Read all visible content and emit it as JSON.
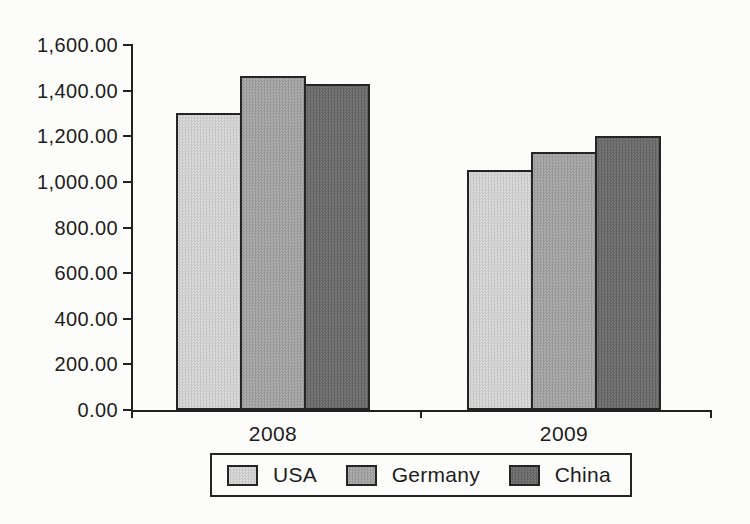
{
  "chart_data": {
    "type": "bar",
    "title": "",
    "categories": [
      "2008",
      "2009"
    ],
    "series": [
      {
        "name": "USA",
        "color": "#dcdcdc",
        "values": [
          1300,
          1050
        ]
      },
      {
        "name": "Germany",
        "color": "#a9a9a9",
        "values": [
          1465,
          1130
        ]
      },
      {
        "name": "China",
        "color": "#6e6e6e",
        "values": [
          1430,
          1200
        ]
      }
    ],
    "xlabel": "",
    "ylabel": "",
    "ylim": [
      0,
      1600
    ],
    "ytick_step": 200,
    "ytick_labels_top_to_bottom": [
      "1,600.00",
      "1,400.00",
      "1,200.00",
      "1,000.00",
      "800.00",
      "600.00",
      "400.00",
      "200.00",
      "0.00"
    ],
    "grid": false,
    "legend_position": "bottom",
    "axis_color": "#212121",
    "bar_border_color": "#242424"
  }
}
